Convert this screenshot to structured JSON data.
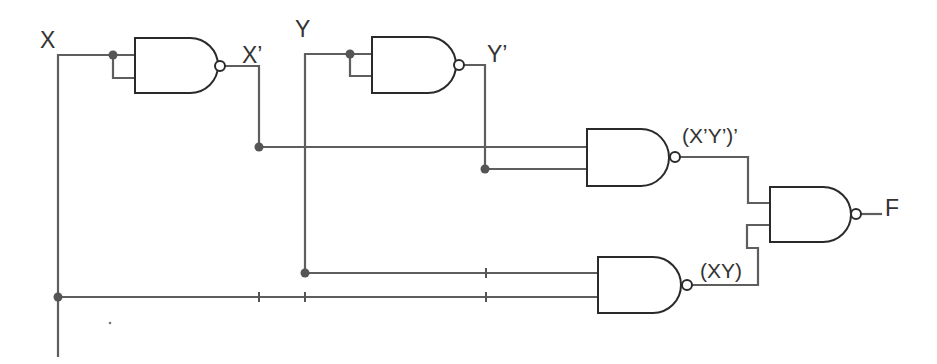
{
  "diagram": {
    "type": "logic-circuit",
    "colors": {
      "wire": "#5e5e5e",
      "gate_outline": "#2a2a2a",
      "junction": "#555555",
      "label": "#333333",
      "background": "#ffffff"
    },
    "inputs": [
      {
        "id": "X",
        "label": "X"
      },
      {
        "id": "Y",
        "label": "Y"
      }
    ],
    "outputs": [
      {
        "id": "F",
        "label": "F"
      }
    ],
    "gates": [
      {
        "id": "g1",
        "type": "NAND",
        "inputs": [
          "X",
          "X"
        ],
        "output_label": "X’"
      },
      {
        "id": "g2",
        "type": "NAND",
        "inputs": [
          "Y",
          "Y"
        ],
        "output_label": "Y’"
      },
      {
        "id": "g3",
        "type": "NAND",
        "inputs": [
          "X’",
          "Y’"
        ],
        "output_label": "(X’Y’)’"
      },
      {
        "id": "g5",
        "type": "NAND",
        "inputs": [
          "Y",
          "X"
        ],
        "output_label": "(XY)"
      },
      {
        "id": "g4",
        "type": "NAND",
        "inputs": [
          "(X’Y’)’",
          "(XY)"
        ],
        "output_label": "F"
      }
    ],
    "labels": {
      "x_input": "X",
      "y_input": "Y",
      "x_not": "X’",
      "y_not": "Y’",
      "xy_nand_not": "(X’Y’)’",
      "xy": "(XY)",
      "f_output": "F"
    }
  }
}
